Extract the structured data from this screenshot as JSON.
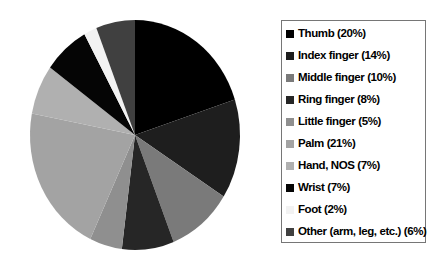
{
  "chart_data": {
    "type": "pie",
    "title": "",
    "legend_position": "right",
    "start_angle": "top",
    "direction": "clockwise",
    "categories": [
      "Thumb",
      "Index finger",
      "Middle finger",
      "Ring finger",
      "Little finger",
      "Palm",
      "Hand, NOS",
      "Wrist",
      "Foot",
      "Other (arm, leg, etc.)"
    ],
    "values": [
      20,
      14,
      10,
      8,
      5,
      21,
      7,
      7,
      2,
      6
    ],
    "unit": "%",
    "slices": [
      {
        "label": "Thumb",
        "value": 20,
        "legend_label": "Thumb (20%)",
        "color": "#000000"
      },
      {
        "label": "Index finger",
        "value": 14,
        "legend_label": "Index finger (14%)",
        "color": "#1e1e1e"
      },
      {
        "label": "Middle finger",
        "value": 10,
        "legend_label": "Middle finger (10%)",
        "color": "#7a7a7a"
      },
      {
        "label": "Ring finger",
        "value": 8,
        "legend_label": "Ring finger (8%)",
        "color": "#262626"
      },
      {
        "label": "Little finger",
        "value": 5,
        "legend_label": "Little finger (5%)",
        "color": "#8f8f8f"
      },
      {
        "label": "Palm",
        "value": 21,
        "legend_label": "Palm (21%)",
        "color": "#a3a3a3"
      },
      {
        "label": "Hand, NOS",
        "value": 7,
        "legend_label": "Hand, NOS (7%)",
        "color": "#b0b0b0"
      },
      {
        "label": "Wrist",
        "value": 7,
        "legend_label": "Wrist (7%)",
        "color": "#050505"
      },
      {
        "label": "Foot",
        "value": 2,
        "legend_label": "Foot (2%)",
        "color": "#f2f2f2"
      },
      {
        "label": "Other (arm, leg, etc.)",
        "value": 6,
        "legend_label": "Other (arm, leg, etc.) (6%)",
        "color": "#404040"
      }
    ]
  },
  "style": {
    "background": "#ffffff",
    "legend_border_color": "#767676",
    "legend_text_color": "#000000"
  }
}
